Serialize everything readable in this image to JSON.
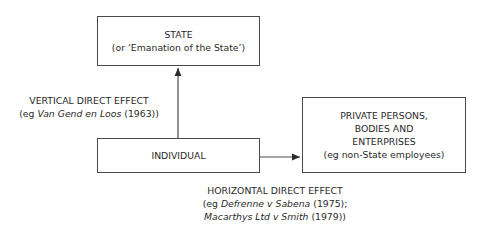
{
  "diagram": {
    "nodes": {
      "state": {
        "line1": "STATE",
        "line2": "(or ‘Emanation of the State’)"
      },
      "individual": {
        "label": "INDIVIDUAL"
      },
      "private": {
        "line1": "PRIVATE PERSONS,",
        "line2": "BODIES AND",
        "line3": "ENTERPRISES",
        "line4": "(eg non-State employees)"
      }
    },
    "edges": {
      "vertical": {
        "from": "individual",
        "to": "state",
        "title": "VERTICAL DIRECT EFFECT",
        "ex_prefix": "(eg ",
        "ex_case": "Van Gend en Loos",
        "ex_suffix": " (1963))"
      },
      "horizontal": {
        "from": "individual",
        "to": "private",
        "title": "HORIZONTAL DIRECT EFFECT",
        "ex1_prefix": "(eg ",
        "ex1_case": "Defrenne v Sabena",
        "ex1_suffix": " (1975);",
        "ex2_case": "Macarthys Ltd v Smith",
        "ex2_suffix": " (1979))"
      }
    },
    "colors": {
      "line": "#4a4a4a",
      "text": "#2a2a2a"
    }
  }
}
